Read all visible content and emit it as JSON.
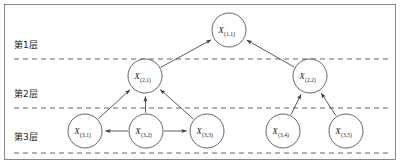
{
  "figure": {
    "type": "hierarchical-directed-graph",
    "width": 400,
    "height": 164,
    "background_color": "#ffffff",
    "border_color": "#6b6b6b",
    "node_stroke_color": "#4a4a4a",
    "edge_color": "#3d3d3d",
    "divider_color": "#555555"
  },
  "layer_labels": [
    {
      "id": "layer-1",
      "text": "第1层",
      "x": 14,
      "y": 48
    },
    {
      "id": "layer-2",
      "text": "第2层",
      "x": 14,
      "y": 97
    },
    {
      "id": "layer-3",
      "text": "第3层",
      "x": 14,
      "y": 140
    }
  ],
  "dividers": [
    {
      "id": "divider-1",
      "y": 59,
      "x1": 14,
      "x2": 388
    },
    {
      "id": "divider-2",
      "y": 108,
      "x1": 14,
      "x2": 388
    },
    {
      "id": "divider-3",
      "y": 153,
      "x1": 14,
      "x2": 388
    }
  ],
  "nodes": [
    {
      "id": "x-1-1",
      "base": "X",
      "sub": "(1,1)",
      "cx": 229,
      "cy": 30,
      "r": 17,
      "layer": 1
    },
    {
      "id": "x-2-1",
      "base": "X",
      "sub": "(2,1)",
      "cx": 145,
      "cy": 76,
      "r": 17,
      "layer": 2
    },
    {
      "id": "x-2-2",
      "base": "X",
      "sub": "(2,2)",
      "cx": 310,
      "cy": 76,
      "r": 17,
      "layer": 2
    },
    {
      "id": "x-3-1",
      "base": "X",
      "sub": "(3,1)",
      "cx": 85,
      "cy": 131,
      "r": 17,
      "layer": 3
    },
    {
      "id": "x-3-2",
      "base": "X",
      "sub": "(3,2)",
      "cx": 146,
      "cy": 131,
      "r": 17,
      "layer": 3
    },
    {
      "id": "x-3-3",
      "base": "X",
      "sub": "(3,3)",
      "cx": 207,
      "cy": 131,
      "r": 17,
      "layer": 3
    },
    {
      "id": "x-3-4",
      "base": "X",
      "sub": "(3,4)",
      "cx": 283,
      "cy": 131,
      "r": 17,
      "layer": 3
    },
    {
      "id": "x-3-5",
      "base": "X",
      "sub": "(3,5)",
      "cx": 346,
      "cy": 131,
      "r": 17,
      "layer": 3
    }
  ],
  "edges": [
    {
      "id": "edge-x21-x11",
      "from": "x-2-1",
      "to": "x-1-1",
      "directed": true
    },
    {
      "id": "edge-x22-x11",
      "from": "x-2-2",
      "to": "x-1-1",
      "directed": true
    },
    {
      "id": "edge-x31-x21",
      "from": "x-3-1",
      "to": "x-2-1",
      "directed": true
    },
    {
      "id": "edge-x32-x21",
      "from": "x-3-2",
      "to": "x-2-1",
      "directed": true
    },
    {
      "id": "edge-x33-x21",
      "from": "x-3-3",
      "to": "x-2-1",
      "directed": true
    },
    {
      "id": "edge-x34-x22",
      "from": "x-3-4",
      "to": "x-2-2",
      "directed": true
    },
    {
      "id": "edge-x35-x22",
      "from": "x-3-5",
      "to": "x-2-2",
      "directed": true
    },
    {
      "id": "edge-x32-x31",
      "from": "x-3-2",
      "to": "x-3-1",
      "directed": true
    },
    {
      "id": "edge-x32-x33",
      "from": "x-3-2",
      "to": "x-3-3",
      "directed": true
    }
  ]
}
